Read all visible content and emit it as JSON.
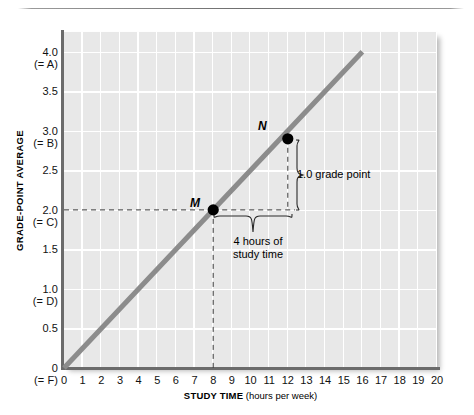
{
  "chart_data": {
    "type": "line",
    "title": "",
    "xlabel_strong": "STUDY TIME",
    "xlabel_light": "(hours per week)",
    "ylabel": "GRADE-POINT AVERAGE",
    "xlim": [
      0,
      20
    ],
    "ylim": [
      0,
      4.25
    ],
    "grid": true,
    "legend": "none",
    "x_ticks": [
      "0",
      "1",
      "2",
      "3",
      "4",
      "5",
      "6",
      "7",
      "8",
      "9",
      "10",
      "11",
      "12",
      "13",
      "14",
      "15",
      "16",
      "17",
      "18",
      "19",
      "20"
    ],
    "x_tick_values": [
      0,
      1,
      2,
      3,
      4,
      5,
      6,
      7,
      8,
      9,
      10,
      11,
      12,
      13,
      14,
      15,
      16,
      17,
      18,
      19,
      20
    ],
    "y_ticks": [
      {
        "value": 4.0,
        "label": "4.0",
        "sublabel": "(= A)"
      },
      {
        "value": 3.5,
        "label": "3.5",
        "sublabel": ""
      },
      {
        "value": 3.0,
        "label": "3.0",
        "sublabel": "(= B)"
      },
      {
        "value": 2.5,
        "label": "2.5",
        "sublabel": ""
      },
      {
        "value": 2.0,
        "label": "2.0",
        "sublabel": "(= C)"
      },
      {
        "value": 1.5,
        "label": "1.5",
        "sublabel": ""
      },
      {
        "value": 1.0,
        "label": "1.0",
        "sublabel": "(= D)"
      },
      {
        "value": 0.5,
        "label": "0.5",
        "sublabel": ""
      },
      {
        "value": 0.0,
        "label": "0",
        "sublabel": "(= F)"
      }
    ],
    "series": [
      {
        "name": "grade-point average vs study time",
        "x": [
          0,
          16
        ],
        "y": [
          0,
          4.0
        ],
        "color": "#8c8c8c",
        "slope": 0.25
      }
    ],
    "points": [
      {
        "label": "M",
        "x": 8,
        "y": 2.0
      },
      {
        "label": "N",
        "x": 12,
        "y": 3.0
      }
    ],
    "annotations": [
      {
        "name": "rise",
        "text": "1.0 grade point"
      },
      {
        "name": "run",
        "line1": "4 hours of",
        "line2": "study time"
      }
    ]
  },
  "colors": {
    "plot_background": "#e8e8e8",
    "gridline": "#ffffff",
    "axis": "#6b6b6b",
    "line": "#8c8c8c",
    "point": "#000000",
    "text": "#111111"
  }
}
